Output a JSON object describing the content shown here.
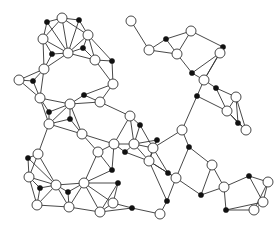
{
  "diagram": {
    "type": "graph",
    "colors": {
      "edge": "#333333",
      "white_node_fill": "#ffffff",
      "black_node_fill": "#111111",
      "background": "#ffffff"
    },
    "white_radius": 5,
    "black_radius": 2.6,
    "white_nodes": [
      [
        62,
        18
      ],
      [
        43,
        39
      ],
      [
        88,
        35
      ],
      [
        68,
        53
      ],
      [
        95,
        60
      ],
      [
        19,
        80
      ],
      [
        44,
        69
      ],
      [
        40,
        98
      ],
      [
        70,
        104
      ],
      [
        100,
        102
      ],
      [
        113,
        84
      ],
      [
        131,
        21
      ],
      [
        149,
        50
      ],
      [
        177,
        54
      ],
      [
        191,
        31
      ],
      [
        204,
        80
      ],
      [
        220,
        53
      ],
      [
        236,
        97
      ],
      [
        227,
        111
      ],
      [
        246,
        130
      ],
      [
        212,
        165
      ],
      [
        224,
        187
      ],
      [
        176,
        178
      ],
      [
        160,
        214
      ],
      [
        149,
        161
      ],
      [
        153,
        148
      ],
      [
        134,
        144
      ],
      [
        130,
        116
      ],
      [
        114,
        144
      ],
      [
        98,
        152
      ],
      [
        82,
        134
      ],
      [
        49,
        124
      ],
      [
        38,
        154
      ],
      [
        29,
        177
      ],
      [
        56,
        185
      ],
      [
        84,
        183
      ],
      [
        37,
        205
      ],
      [
        69,
        207
      ],
      [
        113,
        203
      ],
      [
        100,
        212
      ],
      [
        182,
        130
      ],
      [
        263,
        202
      ],
      [
        254,
        210
      ],
      [
        268,
        182
      ]
    ],
    "black_nodes": [
      [
        47,
        22
      ],
      [
        79,
        20
      ],
      [
        52,
        54
      ],
      [
        83,
        48
      ],
      [
        33,
        81
      ],
      [
        49,
        112
      ],
      [
        112,
        61
      ],
      [
        166,
        39
      ],
      [
        192,
        73
      ],
      [
        223,
        47
      ],
      [
        216,
        88
      ],
      [
        238,
        123
      ],
      [
        197,
        96
      ],
      [
        189,
        147
      ],
      [
        157,
        140
      ],
      [
        168,
        173
      ],
      [
        132,
        208
      ],
      [
        167,
        201
      ],
      [
        70,
        119
      ],
      [
        84,
        95
      ],
      [
        118,
        183
      ],
      [
        28,
        158
      ],
      [
        40,
        188
      ],
      [
        68,
        192
      ],
      [
        125,
        152
      ],
      [
        249,
        176
      ],
      [
        226,
        210
      ],
      [
        201,
        195
      ],
      [
        112,
        170
      ],
      [
        140,
        125
      ]
    ]
  }
}
